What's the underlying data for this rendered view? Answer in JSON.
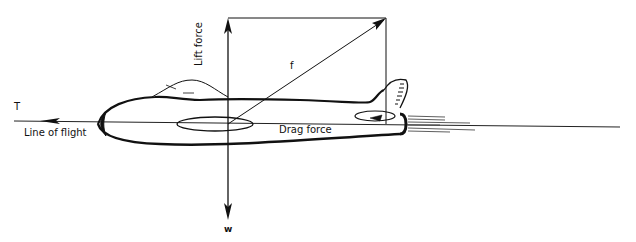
{
  "diagram": {
    "labels": {
      "thrust": "T",
      "line_of_flight": "Line of flight",
      "lift": "Lift force",
      "resultant": "f",
      "drag": "Drag force",
      "weight": "w"
    },
    "colors": {
      "ink": "#111111",
      "background": "#ffffff"
    }
  }
}
